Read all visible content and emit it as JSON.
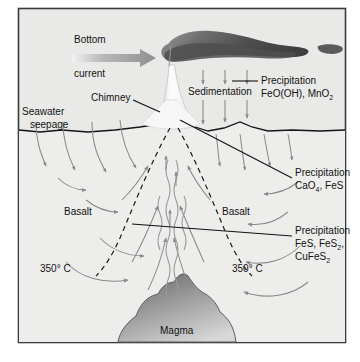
{
  "figure": {
    "kind": "hydrothermal-vent-cross-section-diagram",
    "frame_border_color": "#3b3b3b",
    "background_color": "#ffffff"
  },
  "colors": {
    "water_fill": "#e9e9e7",
    "crust_fill": "#ededeb",
    "plume_dark": "#4a4a4a",
    "plume_light": "#8f8f8f",
    "magma_dark": "#6e6e6e",
    "magma_light": "#d2d2d2",
    "arrow_gray": "#8a8a8a",
    "line_black": "#111111",
    "current_arrow": "#9a9a9a",
    "chimney_white": "#fbfbfb"
  },
  "labels": {
    "bottom_current_line1": "Bottom",
    "bottom_current_line2": "current",
    "chimney": "Chimney",
    "seawater_line1": "Seawater",
    "seawater_line2": "seepage",
    "sedimentation": "Sedimentation",
    "basalt_left": "Basalt",
    "basalt_right": "Basalt",
    "temp_left": "350° C",
    "temp_right": "350° C",
    "magma": "Magma"
  },
  "precipitation": {
    "top": {
      "title": "Precipitation",
      "formula_parts": [
        {
          "text": "FeO(OH), MnO",
          "sub": false
        },
        {
          "text": "2",
          "sub": true
        }
      ],
      "formula_plain": "FeO(OH), MnO2"
    },
    "middle": {
      "title": "Precipitation",
      "formula_parts": [
        {
          "text": "CaO",
          "sub": false
        },
        {
          "text": "4",
          "sub": true
        },
        {
          "text": ", FeS",
          "sub": false
        }
      ],
      "formula_plain": "CaO4, FeS"
    },
    "bottom": {
      "title": "Precipitation",
      "line1_parts": [
        {
          "text": "FeS, FeS",
          "sub": false
        },
        {
          "text": "2",
          "sub": true
        },
        {
          "text": ",",
          "sub": false
        }
      ],
      "line2_parts": [
        {
          "text": "CuFeS",
          "sub": false
        },
        {
          "text": "2",
          "sub": true
        }
      ],
      "formula_plain": "FeS, FeS2, CuFeS2"
    }
  },
  "icons": {
    "current_arrow": "right-arrow-gradient-icon",
    "sediment_arrows": "down-arrow-icon",
    "seepage_arrows": "down-curved-arrow-icon",
    "convection_arrows": "curved-circulation-arrow-icon",
    "upflow": "wavy-upflow-icon",
    "isotherm": "dashed-isotherm-line-icon"
  }
}
